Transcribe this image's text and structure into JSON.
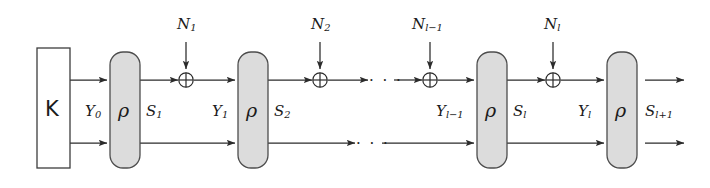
{
  "figure": {
    "type": "block-diagram",
    "key_block": {
      "label": "K",
      "name": "key-block"
    },
    "permutation_symbol": "ρ",
    "xor_symbol": "⊕",
    "ellipsis": "· · ·",
    "colors": {
      "block_fill": "#dcdcdc",
      "block_stroke": "#4d4d4d",
      "line": "#2b2b2b",
      "text": "#1a1a1a",
      "background": "#ffffff"
    },
    "lanes": {
      "top_y": 80,
      "bottom_y": 143
    },
    "rho_blocks": [
      {
        "name": "rho-block-1",
        "label": "ρ",
        "x": 110
      },
      {
        "name": "rho-block-2",
        "label": "ρ",
        "x": 238
      },
      {
        "name": "rho-block-3",
        "label": "ρ",
        "x": 477
      },
      {
        "name": "rho-block-4",
        "label": "ρ",
        "x": 607
      }
    ],
    "xor_nodes": [
      {
        "name": "xor-node-1",
        "symbol": "⊕",
        "input_label_base": "N",
        "input_label_sub": "1"
      },
      {
        "name": "xor-node-2",
        "symbol": "⊕",
        "input_label_base": "N",
        "input_label_sub": "2"
      },
      {
        "name": "xor-node-3",
        "symbol": "⊕",
        "input_label_base": "N",
        "input_label_sub": "l−1"
      },
      {
        "name": "xor-node-4",
        "symbol": "⊕",
        "input_label_base": "N",
        "input_label_sub": "l"
      }
    ],
    "nonce_labels": [
      {
        "base": "N",
        "sub": "1"
      },
      {
        "base": "N",
        "sub": "2"
      },
      {
        "base": "N",
        "sub": "l−1"
      },
      {
        "base": "N",
        "sub": "l"
      }
    ],
    "state_labels": [
      {
        "base": "Y",
        "sub": "0"
      },
      {
        "base": "S",
        "sub": "1"
      },
      {
        "base": "Y",
        "sub": "1"
      },
      {
        "base": "S",
        "sub": "2"
      },
      {
        "base": "Y",
        "sub": "l−1"
      },
      {
        "base": "S",
        "sub": "l"
      },
      {
        "base": "Y",
        "sub": "l"
      },
      {
        "base": "S",
        "sub": "l+1"
      }
    ],
    "labels": {
      "Y0_base": "Y",
      "Y0_sub": "0",
      "S1_base": "S",
      "S1_sub": "1",
      "Y1_base": "Y",
      "Y1_sub": "1",
      "S2_base": "S",
      "S2_sub": "2",
      "Ylm1_base": "Y",
      "Ylm1_sub": "l−1",
      "Sl_base": "S",
      "Sl_sub": "l",
      "Yl_base": "Y",
      "Yl_sub": "l",
      "Slp1_base": "S",
      "Slp1_sub": "l+1",
      "N1_base": "N",
      "N1_sub": "1",
      "N2_base": "N",
      "N2_sub": "2",
      "Nlm1_base": "N",
      "Nlm1_sub": "l−1",
      "Nl_base": "N",
      "Nl_sub": "l",
      "rho1": "ρ",
      "rho2": "ρ",
      "rho3": "ρ",
      "rho4": "ρ",
      "K": "K",
      "dots_top": "· · ·",
      "dots_bottom": "· · ·"
    }
  }
}
